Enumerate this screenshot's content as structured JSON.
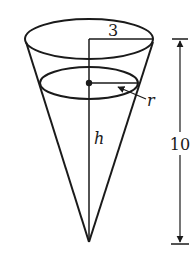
{
  "diagram": {
    "type": "conical-tank",
    "labels": {
      "top_radius": "3",
      "water_radius": "r",
      "water_height": "h",
      "tank_height": "10"
    },
    "colors": {
      "stroke": "#1a1a1a",
      "background": "#ffffff"
    }
  }
}
